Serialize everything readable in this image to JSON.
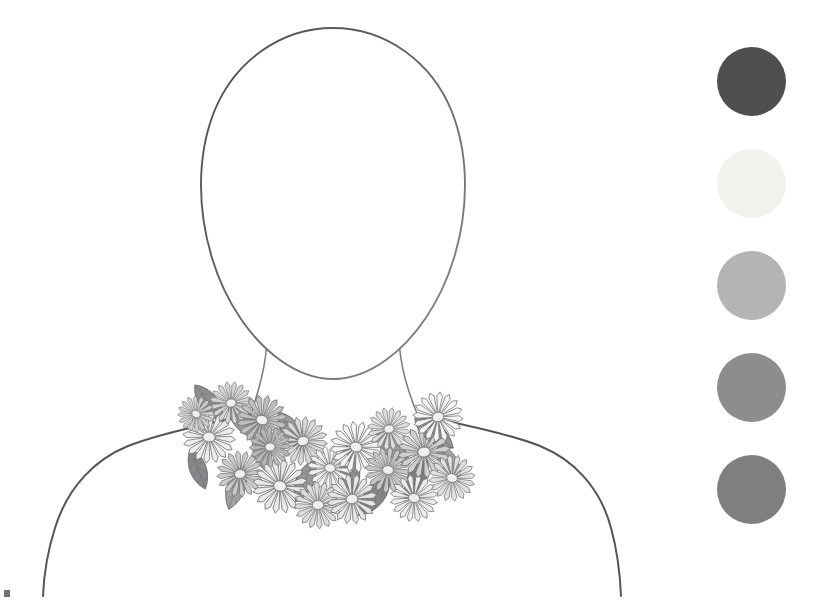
{
  "canvas": {
    "width": 827,
    "height": 601,
    "background": "#ffffff",
    "title": "Floral Bib Necklace Design Sheet",
    "medium": "grayscale pencil and marker rendering"
  },
  "figure": {
    "label": "Croquis bust outline",
    "head_label": "Head outline",
    "neck_label": "Neck outline",
    "shoulders_label": "Shoulder line",
    "outline_color": "#55555a",
    "fill_color": "#ffffff",
    "stroke_width": "1.6"
  },
  "necklace": {
    "label": "Floral bib necklace",
    "style": "Bib / collar",
    "motif": "Layered daisy blossoms with pointed leaves",
    "flower_count": 18,
    "leaf_count": 13,
    "outline_color": "#6b6b70",
    "flower_tones": [
      "#f4f4f2",
      "#e3e3e0",
      "#cfcfcc",
      "#b9b9b6",
      "#a3a3a0"
    ],
    "leaf_tones": [
      "#8e8e8b",
      "#9d9d9a",
      "#7d7d7a",
      "#acaca9"
    ],
    "center_tone": "#efefec"
  },
  "palette": {
    "label": "Colourway swatches",
    "count": 5,
    "swatches": [
      {
        "name": "swatch-1",
        "label": "Charcoal",
        "hex": "#4f4f51",
        "position": 1
      },
      {
        "name": "swatch-2",
        "label": "Off White",
        "hex": "#f2f2ef",
        "position": 2
      },
      {
        "name": "swatch-3",
        "label": "Light Grey",
        "hex": "#b4b4b2",
        "position": 3
      },
      {
        "name": "swatch-4",
        "label": "Mid Grey",
        "hex": "#8d8d8d",
        "position": 4
      },
      {
        "name": "swatch-5",
        "label": "Slate Grey",
        "hex": "#7f7f80",
        "position": 5
      }
    ]
  },
  "corner_mark": {
    "label": "Scan artifact mark",
    "color": "#58585a"
  }
}
